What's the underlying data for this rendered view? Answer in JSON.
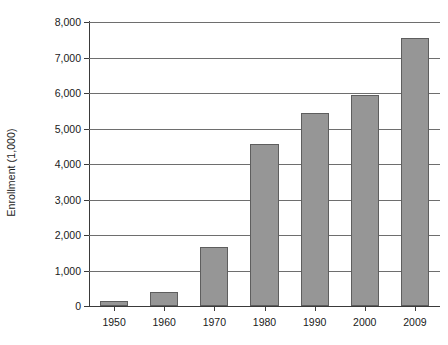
{
  "chart_data": {
    "type": "bar",
    "title": "",
    "xlabel": "",
    "ylabel": "Enrollment (1,000)",
    "categories": [
      "1950",
      "1960",
      "1970",
      "1980",
      "1990",
      "2000",
      "2009"
    ],
    "values": [
      155,
      400,
      1650,
      4550,
      5430,
      5950,
      7540
    ],
    "ylim": [
      0,
      8000
    ],
    "ytick_labels": [
      "0",
      "1,000",
      "2,000",
      "3,000",
      "4,000",
      "5,000",
      "6,000",
      "7,000",
      "8,000"
    ],
    "ytick_values": [
      0,
      1000,
      2000,
      3000,
      4000,
      5000,
      6000,
      7000,
      8000
    ],
    "grid": true,
    "legend": "none",
    "bar_color": "#969696",
    "bar_border_color": "#5e5e5e",
    "grid_color": "#6e6e6e",
    "axis_color": "#3a3a3a"
  }
}
